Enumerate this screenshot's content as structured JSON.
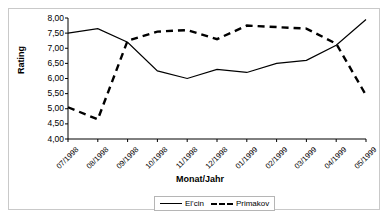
{
  "chart_data": {
    "type": "line",
    "title": "",
    "xlabel": "Monat/Jahr",
    "ylabel": "Rating",
    "categories": [
      "07/1998",
      "08/1998",
      "09/1998",
      "10/1998",
      "11/1998",
      "12/1998",
      "01/1999",
      "02/1999",
      "03/1999",
      "04/1999",
      "05/1999"
    ],
    "series": [
      {
        "name": "El'cin",
        "style": "solid",
        "color": "#000000",
        "values": [
          7.5,
          7.65,
          7.2,
          6.25,
          6.0,
          6.3,
          6.2,
          6.5,
          6.6,
          7.1,
          7.95
        ]
      },
      {
        "name": "Primakov",
        "style": "dashed",
        "color": "#000000",
        "values": [
          5.05,
          4.65,
          7.25,
          7.55,
          7.6,
          7.3,
          7.75,
          7.7,
          7.65,
          7.15,
          5.45
        ]
      }
    ],
    "ylim": [
      4.0,
      8.0
    ],
    "ytick_values": [
      "8,00",
      "7,50",
      "7,00",
      "6,50",
      "6,00",
      "5,50",
      "5,00",
      "4,50",
      "4,00"
    ],
    "ytick_numbers": [
      8.0,
      7.5,
      7.0,
      6.5,
      6.0,
      5.5,
      5.0,
      4.5,
      4.0
    ],
    "grid": false,
    "legend_position": "bottom-right",
    "decimal_separator": ","
  },
  "legend": {
    "entries": [
      {
        "label": "El'cin"
      },
      {
        "label": "Primakov"
      }
    ]
  },
  "colors": {
    "line": "#000000",
    "axis": "#000000",
    "frame": "#c9c9c9",
    "background": "#ffffff"
  }
}
